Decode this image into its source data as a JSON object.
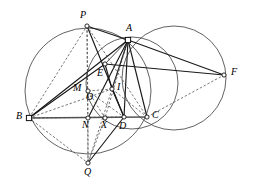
{
  "figure": {
    "background_color": "#ffffff",
    "stroke_color": "#1a1a1a",
    "circle_color": "#3a3a3a",
    "dashed_color": "#4a4a4a",
    "width": 254,
    "height": 189
  },
  "points": [
    {
      "id": "P",
      "label": "P",
      "x": 87,
      "y": 26,
      "marker": "dot",
      "label_x": 80,
      "label_y": 10
    },
    {
      "id": "A",
      "label": "A",
      "x": 128,
      "y": 40,
      "marker": "square",
      "label_x": 126,
      "label_y": 23
    },
    {
      "id": "F",
      "label": "F",
      "x": 224,
      "y": 75,
      "marker": "dot",
      "label_x": 231,
      "label_y": 67
    },
    {
      "id": "E",
      "label": "E",
      "x": 105,
      "y": 64,
      "marker": "dot",
      "label_x": 97,
      "label_y": 68
    },
    {
      "id": "M",
      "label": "M",
      "x": 88,
      "y": 91,
      "marker": "dot",
      "label_x": 73,
      "label_y": 83
    },
    {
      "id": "O",
      "label": "O",
      "x": 88,
      "y": 91,
      "marker": "none",
      "label_x": 86,
      "label_y": 92
    },
    {
      "id": "I",
      "label": "I",
      "x": 112,
      "y": 89,
      "marker": "dot",
      "label_x": 117,
      "label_y": 82
    },
    {
      "id": "B",
      "label": "B",
      "x": 29,
      "y": 118,
      "marker": "square",
      "label_x": 16,
      "label_y": 111
    },
    {
      "id": "N",
      "label": "N",
      "x": 88,
      "y": 118,
      "marker": "dot",
      "label_x": 82,
      "label_y": 120
    },
    {
      "id": "X",
      "label": "X",
      "x": 105,
      "y": 118,
      "marker": "dot",
      "label_x": 101,
      "label_y": 120
    },
    {
      "id": "D",
      "label": "D",
      "x": 124,
      "y": 117,
      "marker": "dot",
      "label_x": 119,
      "label_y": 121
    },
    {
      "id": "C",
      "label": "C",
      "x": 147,
      "y": 117,
      "marker": "dot",
      "label_x": 152,
      "label_y": 110
    },
    {
      "id": "Q",
      "label": "Q",
      "x": 88,
      "y": 163,
      "marker": "dot",
      "label_x": 84,
      "label_y": 167
    }
  ],
  "circles": [
    {
      "id": "circumcircle",
      "cx": 88,
      "cy": 91,
      "r": 63,
      "style": "solid"
    },
    {
      "id": "right-circle",
      "cx": 174,
      "cy": 78,
      "r": 52,
      "style": "solid"
    },
    {
      "id": "mid-circle",
      "cx": 132,
      "cy": 83,
      "r": 46,
      "style": "solid"
    }
  ],
  "segments": [
    {
      "id": "B-C",
      "from": "B",
      "to": "C",
      "style": "baseline"
    },
    {
      "id": "B-P",
      "from": "B",
      "to": "P",
      "style": "dashed"
    },
    {
      "id": "B-A",
      "from": "B",
      "to": "A",
      "style": "solid"
    },
    {
      "id": "B-E",
      "from": "B",
      "to": "E",
      "style": "solid"
    },
    {
      "id": "B-I",
      "from": "B",
      "to": "I",
      "style": "dashed"
    },
    {
      "id": "B-Q",
      "from": "B",
      "to": "Q",
      "style": "dashed"
    },
    {
      "id": "B-D",
      "from": "B",
      "to": "D",
      "style": "dashed"
    },
    {
      "id": "P-A",
      "from": "P",
      "to": "A",
      "style": "solid"
    },
    {
      "id": "P-D",
      "from": "P",
      "to": "D",
      "style": "solid"
    },
    {
      "id": "P-Q",
      "from": "P",
      "to": "Q",
      "style": "dashed"
    },
    {
      "id": "P-N",
      "from": "P",
      "to": "N",
      "style": "dashed"
    },
    {
      "id": "P-C",
      "from": "P",
      "to": "C",
      "style": "dashed"
    },
    {
      "id": "A-F",
      "from": "A",
      "to": "F",
      "style": "solid"
    },
    {
      "id": "A-C",
      "from": "A",
      "to": "C",
      "style": "solid"
    },
    {
      "id": "A-D",
      "from": "A",
      "to": "D",
      "style": "solid"
    },
    {
      "id": "A-I",
      "from": "A",
      "to": "I",
      "style": "solid"
    },
    {
      "id": "A-X",
      "from": "A",
      "to": "X",
      "style": "dashed"
    },
    {
      "id": "A-N",
      "from": "A",
      "to": "N",
      "style": "solid"
    },
    {
      "id": "A-Q",
      "from": "A",
      "to": "Q",
      "style": "dashed"
    },
    {
      "id": "E-F",
      "from": "E",
      "to": "F",
      "style": "solid"
    },
    {
      "id": "E-I",
      "from": "E",
      "to": "I",
      "style": "solid"
    },
    {
      "id": "I-D",
      "from": "I",
      "to": "D",
      "style": "solid"
    },
    {
      "id": "I-C",
      "from": "I",
      "to": "C",
      "style": "dashed"
    },
    {
      "id": "I-M",
      "from": "I",
      "to": "M",
      "style": "dashed"
    },
    {
      "id": "D-Q",
      "from": "D",
      "to": "Q",
      "style": "solid"
    },
    {
      "id": "C-F",
      "from": "C",
      "to": "F",
      "style": "dashed"
    },
    {
      "id": "Q-X",
      "from": "Q",
      "to": "X",
      "style": "dashed"
    },
    {
      "id": "Q-N",
      "from": "Q",
      "to": "N",
      "style": "dashed"
    },
    {
      "id": "M-X",
      "from": "M",
      "to": "X",
      "style": "dashed"
    },
    {
      "id": "M-D",
      "from": "M",
      "to": "D",
      "style": "dashed"
    },
    {
      "id": "E-A",
      "from": "E",
      "to": "A",
      "style": "solid-thin"
    }
  ]
}
